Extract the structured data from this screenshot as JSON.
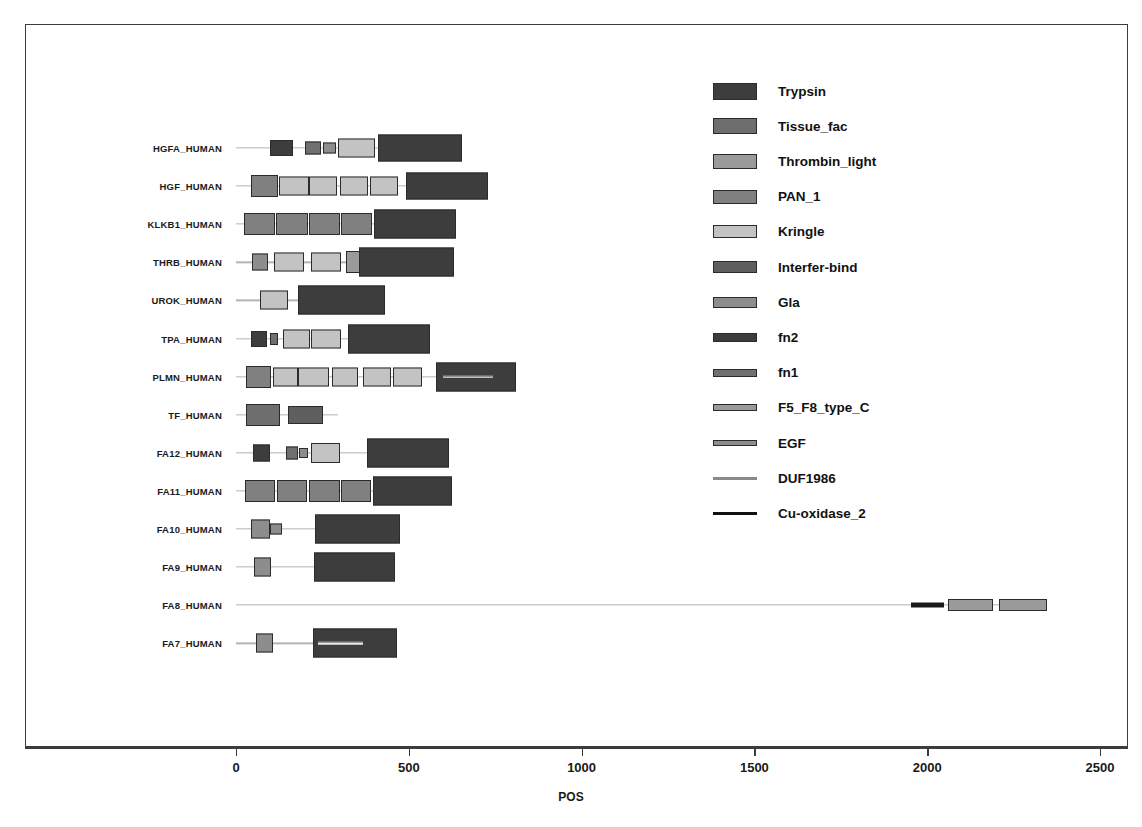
{
  "chart_data": {
    "type": "bar",
    "title": "",
    "xlabel": "POS",
    "ylabel": "",
    "xlim": [
      -110,
      2610
    ],
    "ylim": [
      0,
      14
    ],
    "grid": false,
    "legend_position": "right",
    "axis_ticks": [
      0,
      500,
      1000,
      1500,
      2000,
      2500
    ],
    "axis_tick_labels": [
      "0",
      "500",
      "1000",
      "1500",
      "2000",
      "2500"
    ],
    "domain_colors": {
      "Trypsin": "#3d3d3d",
      "Tissue_fac": "#6e6e6e",
      "Thrombin_light": "#9a9a9a",
      "PAN_1": "#808080",
      "Kringle": "#c3c3c3",
      "Interfer-bind": "#5e5e5e",
      "Gla": "#8d8d8d",
      "fn2": "#3d3d3d",
      "fn1": "#707070",
      "F5_F8_type_C": "#9a9a9a",
      "EGF": "#8d8d8d",
      "DUF1986": "#e9e9e9",
      "Cu-oxidase_2": "#1a1a1a"
    },
    "legend": [
      {
        "label": "Trypsin",
        "color": "#3d3d3d",
        "height": 17
      },
      {
        "label": "Tissue_fac",
        "color": "#6e6e6e",
        "height": 16
      },
      {
        "label": "Thrombin_light",
        "color": "#9a9a9a",
        "height": 15
      },
      {
        "label": "PAN_1",
        "color": "#808080",
        "height": 14
      },
      {
        "label": "Kringle",
        "color": "#c3c3c3",
        "height": 13
      },
      {
        "label": "Interfer-bind",
        "color": "#5e5e5e",
        "height": 12
      },
      {
        "label": "Gla",
        "color": "#8d8d8d",
        "height": 11
      },
      {
        "label": "fn2",
        "color": "#3d3d3d",
        "height": 9
      },
      {
        "label": "fn1",
        "color": "#707070",
        "height": 8
      },
      {
        "label": "F5_F8_type_C",
        "color": "#9a9a9a",
        "height": 7
      },
      {
        "label": "EGF",
        "color": "#8d8d8d",
        "height": 6
      },
      {
        "label": "DUF1986",
        "color": "#8a8a8a",
        "height": 4
      },
      {
        "label": "Cu-oxidase_2",
        "color": "#111111",
        "height": 3
      }
    ],
    "proteins": [
      {
        "name": "HGFA_HUMAN",
        "length": 655,
        "domains": [
          {
            "name": "fn2",
            "start": 98,
            "end": 165,
            "height": 16
          },
          {
            "name": "fn1",
            "start": 200,
            "end": 245,
            "height": 13
          },
          {
            "name": "EGF",
            "start": 252,
            "end": 288,
            "height": 11
          },
          {
            "name": "Kringle",
            "start": 295,
            "end": 403,
            "height": 19
          },
          {
            "name": "Trypsin",
            "start": 412,
            "end": 655,
            "height": 27
          }
        ]
      },
      {
        "name": "HGF_HUMAN",
        "length": 728,
        "domains": [
          {
            "name": "PAN_1",
            "start": 42,
            "end": 123,
            "height": 22
          },
          {
            "name": "Kringle",
            "start": 123,
            "end": 210,
            "height": 19
          },
          {
            "name": "Kringle",
            "start": 210,
            "end": 292,
            "height": 19
          },
          {
            "name": "Kringle",
            "start": 300,
            "end": 383,
            "height": 19
          },
          {
            "name": "Kringle",
            "start": 387,
            "end": 470,
            "height": 19
          },
          {
            "name": "Trypsin",
            "start": 492,
            "end": 728,
            "height": 27
          }
        ]
      },
      {
        "name": "KLKB1_HUMAN",
        "length": 638,
        "domains": [
          {
            "name": "PAN_1",
            "start": 22,
            "end": 112,
            "height": 22
          },
          {
            "name": "PAN_1",
            "start": 115,
            "end": 207,
            "height": 22
          },
          {
            "name": "PAN_1",
            "start": 210,
            "end": 300,
            "height": 22
          },
          {
            "name": "PAN_1",
            "start": 303,
            "end": 393,
            "height": 22
          },
          {
            "name": "Trypsin",
            "start": 398,
            "end": 638,
            "height": 29
          }
        ]
      },
      {
        "name": "THRB_HUMAN",
        "length": 622,
        "domains": [
          {
            "name": "Gla",
            "start": 46,
            "end": 92,
            "height": 17
          },
          {
            "name": "Kringle",
            "start": 110,
            "end": 198,
            "height": 19
          },
          {
            "name": "Kringle",
            "start": 218,
            "end": 303,
            "height": 19
          },
          {
            "name": "Thrombin_light",
            "start": 318,
            "end": 375,
            "height": 22
          },
          {
            "name": "Trypsin",
            "start": 357,
            "end": 632,
            "height": 29
          }
        ]
      },
      {
        "name": "UROK_HUMAN",
        "length": 431,
        "domains": [
          {
            "name": "Kringle",
            "start": 70,
            "end": 150,
            "height": 19
          },
          {
            "name": "Trypsin",
            "start": 178,
            "end": 431,
            "height": 29
          }
        ]
      },
      {
        "name": "TPA_HUMAN",
        "length": 562,
        "domains": [
          {
            "name": "fn2",
            "start": 44,
            "end": 90,
            "height": 16
          },
          {
            "name": "fn1",
            "start": 98,
            "end": 122,
            "height": 12
          },
          {
            "name": "Kringle",
            "start": 135,
            "end": 215,
            "height": 19
          },
          {
            "name": "Kringle",
            "start": 218,
            "end": 305,
            "height": 19
          },
          {
            "name": "Trypsin",
            "start": 325,
            "end": 562,
            "height": 29
          }
        ]
      },
      {
        "name": "PLMN_HUMAN",
        "length": 810,
        "domains": [
          {
            "name": "PAN_1",
            "start": 28,
            "end": 102,
            "height": 22
          },
          {
            "name": "Kringle",
            "start": 108,
            "end": 180,
            "height": 19
          },
          {
            "name": "Kringle",
            "start": 180,
            "end": 268,
            "height": 19
          },
          {
            "name": "Kringle",
            "start": 277,
            "end": 352,
            "height": 19
          },
          {
            "name": "Kringle",
            "start": 368,
            "end": 448,
            "height": 19
          },
          {
            "name": "Kringle",
            "start": 455,
            "end": 538,
            "height": 19
          },
          {
            "name": "Trypsin",
            "start": 580,
            "end": 810,
            "height": 29
          },
          {
            "name": "DUF1986",
            "start": 600,
            "end": 745,
            "height": 5
          }
        ]
      },
      {
        "name": "TF_HUMAN",
        "length": 295,
        "domains": [
          {
            "name": "Tissue_fac",
            "start": 28,
            "end": 128,
            "height": 22
          },
          {
            "name": "Interfer-bind",
            "start": 150,
            "end": 252,
            "height": 18
          }
        ]
      },
      {
        "name": "FA12_HUMAN",
        "length": 615,
        "domains": [
          {
            "name": "fn2",
            "start": 48,
            "end": 97,
            "height": 17
          },
          {
            "name": "fn1",
            "start": 145,
            "end": 178,
            "height": 13
          },
          {
            "name": "EGF",
            "start": 182,
            "end": 208,
            "height": 10
          },
          {
            "name": "Kringle",
            "start": 218,
            "end": 302,
            "height": 20
          },
          {
            "name": "Trypsin",
            "start": 378,
            "end": 615,
            "height": 29
          }
        ]
      },
      {
        "name": "FA11_HUMAN",
        "length": 625,
        "domains": [
          {
            "name": "PAN_1",
            "start": 25,
            "end": 112,
            "height": 22
          },
          {
            "name": "PAN_1",
            "start": 118,
            "end": 205,
            "height": 22
          },
          {
            "name": "PAN_1",
            "start": 212,
            "end": 300,
            "height": 22
          },
          {
            "name": "PAN_1",
            "start": 305,
            "end": 392,
            "height": 22
          },
          {
            "name": "Trypsin",
            "start": 395,
            "end": 625,
            "height": 29
          }
        ]
      },
      {
        "name": "FA10_HUMAN",
        "length": 475,
        "domains": [
          {
            "name": "Gla",
            "start": 42,
            "end": 98,
            "height": 19
          },
          {
            "name": "EGF",
            "start": 98,
            "end": 132,
            "height": 11
          },
          {
            "name": "Trypsin",
            "start": 228,
            "end": 475,
            "height": 29
          }
        ]
      },
      {
        "name": "FA9_HUMAN",
        "length": 461,
        "domains": [
          {
            "name": "Gla",
            "start": 52,
            "end": 100,
            "height": 19
          },
          {
            "name": "Trypsin",
            "start": 225,
            "end": 461,
            "height": 29
          }
        ]
      },
      {
        "name": "FA8_HUMAN",
        "length": 2332,
        "domains": [
          {
            "name": "Cu-oxidase_2",
            "start": 1952,
            "end": 2050,
            "height": 5
          },
          {
            "name": "F5_F8_type_C",
            "start": 2060,
            "end": 2190,
            "height": 12
          },
          {
            "name": "F5_F8_type_C",
            "start": 2208,
            "end": 2348,
            "height": 12
          }
        ]
      },
      {
        "name": "FA7_HUMAN",
        "length": 466,
        "domains": [
          {
            "name": "Gla",
            "start": 58,
            "end": 108,
            "height": 19
          },
          {
            "name": "Trypsin",
            "start": 222,
            "end": 466,
            "height": 29
          },
          {
            "name": "DUF1986",
            "start": 238,
            "end": 368,
            "height": 5
          }
        ]
      }
    ]
  }
}
